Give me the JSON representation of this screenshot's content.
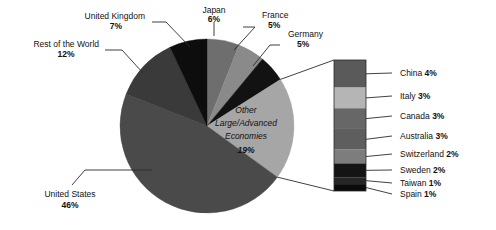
{
  "chart_data": {
    "type": "pie",
    "title": "",
    "subtitle": "",
    "xlabel": "",
    "ylabel": "",
    "legend_position": "callout-right",
    "grid": false,
    "units": "percent",
    "categories": [
      "Japan",
      "France",
      "Germany",
      "Other Large/Advanced Economies",
      "United States",
      "Rest of the World",
      "United Kingdom"
    ],
    "values": [
      6,
      5,
      5,
      19,
      46,
      12,
      7
    ],
    "slices": [
      {
        "label": "Japan",
        "value": 6,
        "value_text": "6%",
        "color": "#6e6e6e",
        "start_deg": 0,
        "end_deg": 21.6
      },
      {
        "label": "France",
        "value": 5,
        "value_text": "5%",
        "color": "#8a8a8a",
        "start_deg": 21.6,
        "end_deg": 39.6
      },
      {
        "label": "Germany",
        "value": 5,
        "value_text": "5%",
        "color": "#121212",
        "start_deg": 39.6,
        "end_deg": 57.6
      },
      {
        "label": "Other Large/Advanced Economies",
        "value": 19,
        "value_text": "19%",
        "color": "#a6a6a6",
        "start_deg": 57.6,
        "end_deg": 126.0
      },
      {
        "label": "United States",
        "value": 46,
        "value_text": "46%",
        "color": "#4a4a4a",
        "start_deg": 126.0,
        "end_deg": 291.6
      },
      {
        "label": "Rest of the World",
        "value": 12,
        "value_text": "12%",
        "color": "#3a3a3a",
        "start_deg": 291.6,
        "end_deg": 334.8
      },
      {
        "label": "United Kingdom",
        "value": 7,
        "value_text": "7%",
        "color": "#0d0d0d",
        "start_deg": 334.8,
        "end_deg": 360.0
      }
    ],
    "breakout": {
      "of_slice": "Other Large/Advanced Economies",
      "of_slice_value": 19,
      "type": "stacked-bar",
      "segments": [
        {
          "label": "China",
          "value": 4,
          "value_text": "4%",
          "color": "#5a5a5a"
        },
        {
          "label": "Italy",
          "value": 3,
          "value_text": "3%",
          "color": "#b5b5b5"
        },
        {
          "label": "Canada",
          "value": 3,
          "value_text": "3%",
          "color": "#676767"
        },
        {
          "label": "Australia",
          "value": 3,
          "value_text": "3%",
          "color": "#5e5e5e"
        },
        {
          "label": "Switzerland",
          "value": 2,
          "value_text": "2%",
          "color": "#7d7d7d"
        },
        {
          "label": "Sweden",
          "value": 2,
          "value_text": "2%",
          "color": "#141414"
        },
        {
          "label": "Taiwan",
          "value": 1,
          "value_text": "1%",
          "color": "#262626"
        },
        {
          "label": "Spain",
          "value": 1,
          "value_text": "1%",
          "color": "#0a0a0a"
        }
      ]
    },
    "inner_label": {
      "line1": "Other",
      "line2": "Large/Advanced",
      "line3": "Economies",
      "line4": "19%"
    },
    "outer_labels": [
      {
        "name": "Japan",
        "line1": "Japan",
        "line2": "6%"
      },
      {
        "name": "France",
        "line1": "France",
        "line2": "5%"
      },
      {
        "name": "Germany",
        "line1": "Germany",
        "line2": "5%"
      },
      {
        "name": "United Kingdom",
        "line1": "United Kingdom",
        "line2": "7%"
      },
      {
        "name": "Rest of the World",
        "line1": "Rest of the World",
        "line2": "12%"
      },
      {
        "name": "United States",
        "line1": "United States",
        "line2": "46%"
      }
    ]
  },
  "labels": {
    "japan_name": "Japan",
    "japan_value": "6%",
    "france_name": "France",
    "france_value": "5%",
    "germany_name": "Germany",
    "germany_value": "5%",
    "uk_name": "United Kingdom",
    "uk_value": "7%",
    "row_name": "Rest of the World",
    "row_value": "12%",
    "us_name": "United States",
    "us_value": "46%",
    "other_line1": "Other",
    "other_line2": "Large/Advanced",
    "other_line3": "Economies",
    "other_value": "19%"
  },
  "breakout_labels": [
    {
      "name": "China",
      "value": "4%"
    },
    {
      "name": "Italy",
      "value": "3%"
    },
    {
      "name": "Canada",
      "value": "3%"
    },
    {
      "name": "Australia",
      "value": "3%"
    },
    {
      "name": "Switzerland",
      "value": "2%"
    },
    {
      "name": "Sweden",
      "value": "2%"
    },
    {
      "name": "Taiwan",
      "value": "1%"
    },
    {
      "name": "Spain",
      "value": "1%"
    }
  ]
}
